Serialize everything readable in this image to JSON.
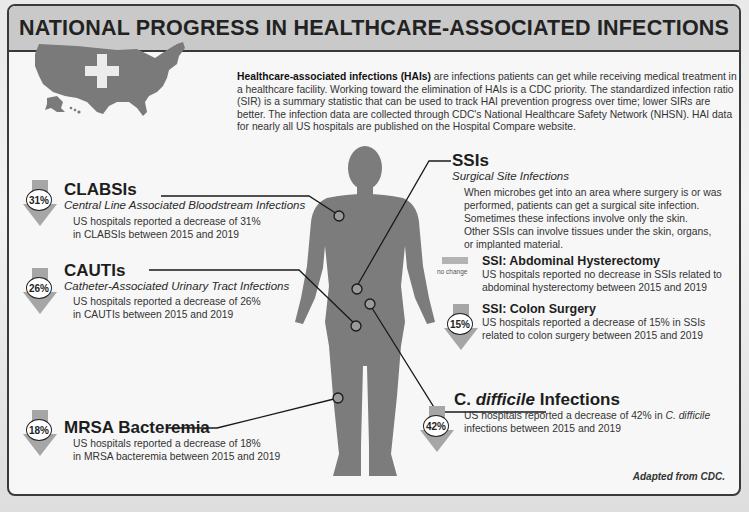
{
  "title": "NATIONAL PROGRESS IN HEALTHCARE-ASSOCIATED INFECTIONS",
  "intro": {
    "bold_lead": "Healthcare-associated infections (HAIs)",
    "text": " are infections patients can get while receiving medical treatment in a healthcare facility. Working toward the elimination of HAIs is a CDC priority. The standardized infection ratio (SIR) is a summary statistic that can be used to track HAI prevention progress over time; lower SIRs are better. The infection data are collected through CDC's National Healthcare Safety Network (NHSN). HAI data for nearly all US hospitals are published on the Hospital Compare website."
  },
  "icons": {
    "map": "us-map-with-cross-icon",
    "body": "human-body-silhouette-icon",
    "decrease": "down-arrow-icon"
  },
  "colors": {
    "title_bar": "#c9c9c9",
    "silhouette": "#7c7c7c",
    "arrow": "#a6a6a6",
    "border": "#3a3a3a"
  },
  "infections": {
    "clabsi": {
      "title": "CLABSIs",
      "subtitle": "Central Line Associated Bloodstream Infections",
      "percent": "31%",
      "desc_line1": "US hospitals reported a decrease of 31%",
      "desc_line2": "in CLABSIs between 2015 and 2019"
    },
    "cauti": {
      "title": "CAUTIs",
      "subtitle": "Catheter-Associated Urinary Tract Infections",
      "percent": "26%",
      "desc_line1": "US hospitals reported a decrease of 26%",
      "desc_line2": "in CAUTIs between 2015 and 2019"
    },
    "mrsa": {
      "title": "MRSA Bacteremia",
      "percent": "18%",
      "desc_line1": "US hospitals reported a decrease of 18%",
      "desc_line2": "in MRSA bacteremia between 2015 and 2019"
    },
    "ssi": {
      "title": "SSIs",
      "subtitle": "Surgical Site Infections",
      "desc_lines": [
        "When microbes get into an area where surgery is or was",
        "performed, patients can get a surgical site infection.",
        "Sometimes these infections involve only the skin.",
        "Other SSIs can involve tissues under the skin, organs,",
        "or implanted material."
      ],
      "abdominal": {
        "title": "SSI: Abdominal Hysterectomy",
        "status": "no change",
        "desc_line1": "US hospitals reported no decrease in SSIs related to",
        "desc_line2": "abdominal hysterectomy between 2015 and 2019"
      },
      "colon": {
        "title": "SSI: Colon Surgery",
        "percent": "15%",
        "desc_line1": "US hospitals reported a decrease of 15% in SSIs",
        "desc_line2": "related to colon surgery between 2015 and 2019"
      }
    },
    "cdiff": {
      "title_prefix": "C. ",
      "title_italic": "difficile",
      "title_suffix": " Infections",
      "percent": "42%",
      "desc_line1_a": "US hospitals reported a decrease of 42% in ",
      "desc_line1_b": "C. difficile",
      "desc_line2": "infections between 2015 and 2019"
    }
  },
  "credit": "Adapted from CDC."
}
